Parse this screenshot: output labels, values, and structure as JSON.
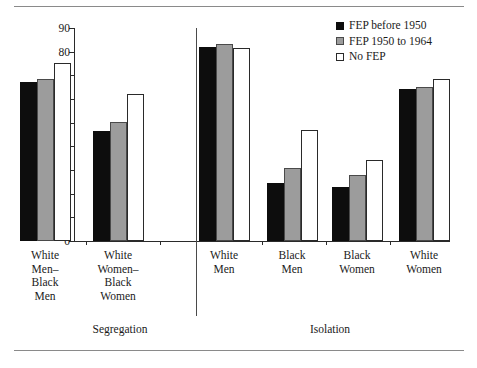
{
  "chart_data": {
    "type": "bar",
    "title": "",
    "subtitle": "",
    "xlabel": "",
    "ylabel": "Percentage",
    "ylim": [
      0,
      90
    ],
    "yticks": [
      0,
      10,
      20,
      30,
      40,
      50,
      60,
      70,
      80,
      90
    ],
    "grid": false,
    "legend_position": "top-right",
    "legend": [
      "FEP before 1950",
      "FEP 1950 to 1964",
      "No FEP"
    ],
    "colors": {
      "FEP before 1950": "#0d0d0d",
      "FEP 1950 to 1964": "#9c9c9c",
      "No FEP": "#ffffff",
      "outline": "#2a2a2a"
    },
    "panels": [
      {
        "name": "Segregation",
        "categories": [
          "White\nMen–\nBlack\nMen",
          "White\nWomen–\nBlack\nWomen"
        ]
      },
      {
        "name": "Isolation",
        "categories": [
          "White\nMen",
          "Black\nMen",
          "Black\nWomen",
          "White\nWomen"
        ]
      }
    ],
    "categories": [
      "White Men–Black Men",
      "White Women–Black Women",
      "White Men",
      "Black Men",
      "Black Women",
      "White Women"
    ],
    "series": [
      {
        "name": "FEP before 1950",
        "values": [
          67.2,
          46.6,
          82.0,
          24.4,
          23.0,
          64.3
        ]
      },
      {
        "name": "FEP 1950 to 1964",
        "values": [
          68.4,
          50.1,
          83.1,
          31.0,
          27.8,
          65.1
        ]
      },
      {
        "name": "No FEP",
        "values": [
          75.3,
          62.0,
          81.7,
          47.1,
          34.3,
          68.4
        ]
      }
    ]
  },
  "axis": {
    "y_label": "Percentage",
    "y_tick_labels": [
      "90",
      "80",
      "70",
      "60",
      "50",
      "40",
      "30",
      "20",
      "10",
      "0"
    ]
  },
  "panels": {
    "segregation_label": "Segregation",
    "isolation_label": "Isolation"
  },
  "group_labels": [
    "White\nMen–\nBlack\nMen",
    "White\nWomen–\nBlack\nWomen",
    "White\nMen",
    "Black\nMen",
    "Black\nWomen",
    "White\nWomen"
  ],
  "legend": {
    "items": [
      {
        "label": "FEP before 1950",
        "swatch": "filled-black-square-icon"
      },
      {
        "label": "FEP 1950 to 1964",
        "swatch": "filled-gray-square-icon"
      },
      {
        "label": "No FEP",
        "swatch": "open-square-icon"
      }
    ]
  }
}
